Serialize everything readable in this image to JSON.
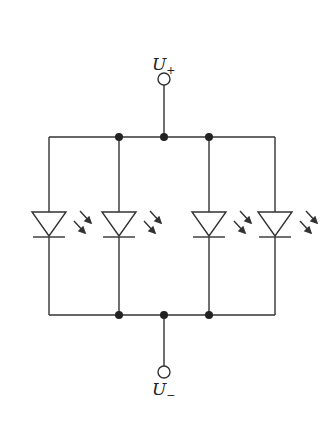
{
  "diagram": {
    "type": "circuit",
    "terminals": {
      "positive": {
        "symbol": "U",
        "subscript": "+"
      },
      "negative": {
        "symbol": "U",
        "subscript": "−"
      }
    },
    "leds": [
      {
        "id": "led-1",
        "x": 49
      },
      {
        "id": "led-2",
        "x": 119
      },
      {
        "id": "led-3",
        "x": 209
      },
      {
        "id": "led-4",
        "x": 275
      }
    ],
    "colors": {
      "line": "#333333",
      "background": "#ffffff"
    }
  }
}
